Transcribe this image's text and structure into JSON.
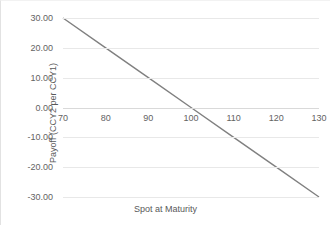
{
  "chart_data": {
    "type": "line",
    "title": "",
    "xlabel": "Spot at Maturity",
    "ylabel": "Payoff (CCY2 per CCY1)",
    "xlim": [
      70,
      130
    ],
    "ylim": [
      -30,
      30
    ],
    "xticks": [
      70,
      80,
      90,
      100,
      110,
      120,
      130
    ],
    "xticklabels": [
      "70",
      "80",
      "90",
      "100",
      "110",
      "120",
      "130"
    ],
    "yticks": [
      30,
      20,
      10,
      0,
      -10,
      -20,
      -30
    ],
    "yticklabels": [
      "30.00",
      "20.00",
      "10.00",
      "0.00",
      "-10.00",
      "-20.00",
      "-30.00"
    ],
    "grid": true,
    "legend": "none",
    "series": [
      {
        "name": "Payoff",
        "color": "#808080",
        "x": [
          70,
          80,
          90,
          100,
          110,
          120,
          130
        ],
        "values": [
          30.0,
          20.0,
          10.0,
          0.0,
          -10.0,
          -20.0,
          -30.0
        ]
      }
    ]
  },
  "axis_color": "#d9d9d9",
  "grid_color": "#e8e8e8",
  "text_color": "#636363"
}
